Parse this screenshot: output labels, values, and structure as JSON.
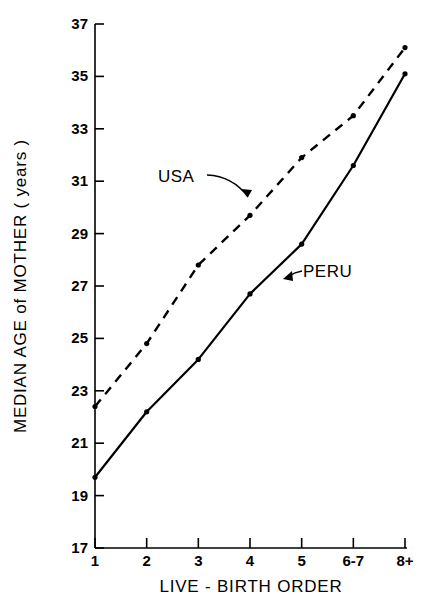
{
  "chart_data": {
    "type": "line",
    "title": "",
    "xlabel": "LIVE - BIRTH  ORDER",
    "ylabel": "MEDIAN  AGE  of  MOTHER  ( years )",
    "categories": [
      "1",
      "2",
      "3",
      "4",
      "5",
      "6-7",
      "8+"
    ],
    "xtick_labels": [
      "1",
      "2",
      "3",
      "4",
      "5",
      "6-7",
      "8+"
    ],
    "ytick_labels": [
      "17",
      "19",
      "21",
      "23",
      "25",
      "27",
      "29",
      "31",
      "33",
      "35",
      "37"
    ],
    "ytick_values": [
      17,
      19,
      21,
      23,
      25,
      27,
      29,
      31,
      33,
      35,
      37
    ],
    "ylim": [
      17,
      37
    ],
    "grid": false,
    "legend_position": "inline-annotations",
    "series": [
      {
        "name": "USA",
        "style": "dashed",
        "marker": "dot",
        "values": [
          22.4,
          24.8,
          27.8,
          29.7,
          31.9,
          33.5,
          36.1
        ]
      },
      {
        "name": "PERU",
        "style": "solid",
        "marker": "dot",
        "values": [
          19.7,
          22.2,
          24.2,
          26.7,
          28.6,
          31.6,
          35.1
        ]
      }
    ],
    "annotations": [
      {
        "text": "USA",
        "points_to_series": "USA",
        "points_to_category": "4"
      },
      {
        "text": "PERU",
        "points_to_series": "PERU",
        "points_to_category": "4"
      }
    ]
  }
}
